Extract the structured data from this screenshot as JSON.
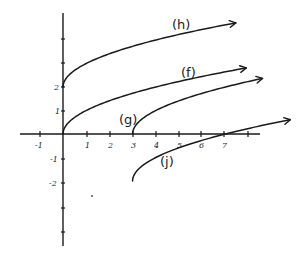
{
  "chart_data": {
    "type": "line",
    "title": "",
    "xlabel": "",
    "ylabel": "",
    "grid": false,
    "legend": "inline labels",
    "xlim": [
      -1.5,
      8.5
    ],
    "ylim": [
      -4.8,
      5.2
    ],
    "x_ticks": [
      -1,
      1,
      2,
      3,
      4,
      5,
      6,
      7,
      8
    ],
    "x_tick_labels": [
      "-1",
      "1",
      "2",
      "3",
      "4",
      "5",
      "6",
      "7",
      ""
    ],
    "y_ticks": [
      -4,
      -3,
      -2,
      -1,
      1,
      2,
      3,
      4
    ],
    "y_tick_labels": [
      "",
      "",
      "-2",
      "-1",
      "1",
      "2",
      "",
      ""
    ],
    "series": [
      {
        "name": "(h)",
        "formula": "y = sqrt(x) + 2",
        "start": [
          0,
          2
        ],
        "points": [
          [
            0,
            2
          ],
          [
            1,
            3
          ],
          [
            4,
            4
          ],
          [
            7.5,
            4.74
          ]
        ],
        "arrow": true
      },
      {
        "name": "(f)",
        "formula": "y = sqrt(x)",
        "start": [
          0,
          0
        ],
        "points": [
          [
            0,
            0
          ],
          [
            1,
            1
          ],
          [
            4,
            2
          ],
          [
            7.9,
            2.81
          ]
        ],
        "arrow": true
      },
      {
        "name": "(g)",
        "formula": "y = sqrt(x - 3)",
        "start": [
          3,
          0
        ],
        "points": [
          [
            3,
            0
          ],
          [
            4,
            1
          ],
          [
            7,
            2
          ],
          [
            8.6,
            2.37
          ]
        ],
        "arrow": true
      },
      {
        "name": "(j)",
        "formula": "y = sqrt(x - 3) - 2",
        "start": [
          3,
          -2
        ],
        "points": [
          [
            3,
            -2
          ],
          [
            4,
            -1
          ],
          [
            7,
            0
          ],
          [
            9.8,
            0.61
          ]
        ],
        "arrow": true
      }
    ],
    "annotations": [
      "(h)",
      "(f)",
      "(g)",
      "(j)"
    ]
  },
  "plot": {
    "origin_px": [
      63,
      134
    ],
    "unit_x_px": 23.2,
    "unit_y_px": 23.5
  },
  "labels": {
    "x_tick_neg1": "-1",
    "x_tick_1": "1",
    "x_tick_2": "2",
    "x_tick_3": "3",
    "x_tick_4": "4",
    "x_tick_5": "5",
    "x_tick_6": "6",
    "x_tick_7": "7",
    "y_tick_2": "2",
    "y_tick_1": "1",
    "y_tick_neg1": "-1",
    "y_tick_neg2": "-2",
    "curve_h": "(h)",
    "curve_f": "(f)",
    "curve_g": "(g)",
    "curve_j": "(j)"
  }
}
